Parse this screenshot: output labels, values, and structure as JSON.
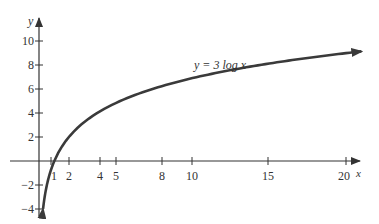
{
  "chart_data": {
    "type": "line",
    "title": "",
    "xlabel": "x",
    "ylabel": "y",
    "annotation": "y = 3 log x",
    "function": "y = 3 ln x",
    "xlim": [
      -1.5,
      21.5
    ],
    "ylim": [
      -4,
      11.5
    ],
    "grid": false,
    "legend": null,
    "x_ticks": [
      1,
      2,
      4,
      5,
      8,
      10,
      15,
      20
    ],
    "y_ticks": [
      -4,
      -2,
      2,
      4,
      6,
      8,
      10
    ],
    "series": [
      {
        "name": "y = 3 log x",
        "x": [
          0.264,
          0.5,
          1,
          2,
          4,
          5,
          8,
          10,
          15,
          20,
          21
        ],
        "y": [
          -4.0,
          -2.08,
          0,
          2.08,
          4.16,
          4.83,
          6.24,
          6.91,
          8.12,
          8.99,
          9.13
        ]
      }
    ],
    "colors": {
      "curve": "#3a3a3a",
      "axis": "#333333"
    }
  },
  "labels": {
    "x_axis": "x",
    "y_axis": "y",
    "curve": "y = 3 log x",
    "x_ticks": [
      "1",
      "2",
      "4",
      "5",
      "8",
      "10",
      "15",
      "20"
    ],
    "y_ticks": [
      "10",
      "8",
      "6",
      "4",
      "2",
      "−2",
      "−4"
    ]
  }
}
